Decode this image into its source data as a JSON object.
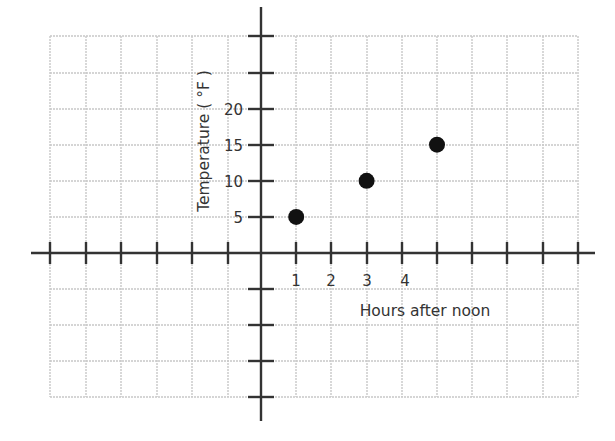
{
  "chart_data": {
    "type": "scatter",
    "title": "",
    "xlabel": "Hours after noon",
    "ylabel": "Temperature ( °F )",
    "x_tick_labels": [
      "1",
      "2",
      "3",
      "4"
    ],
    "y_tick_labels": [
      "5",
      "10",
      "15",
      "20"
    ],
    "x": [
      1,
      3,
      5
    ],
    "y": [
      5,
      10,
      15
    ],
    "points": [
      {
        "x": 1,
        "y": 5
      },
      {
        "x": 3,
        "y": 10
      },
      {
        "x": 5,
        "y": 15
      }
    ],
    "x_unit_per_grid": 1,
    "y_unit_per_grid": 5,
    "xlim": [
      -6,
      9
    ],
    "ylim": [
      -20,
      30
    ],
    "grid": true,
    "legend": null,
    "colors": {
      "point": "#111111",
      "axis": "#333333",
      "grid": "#c8c8c8"
    }
  }
}
